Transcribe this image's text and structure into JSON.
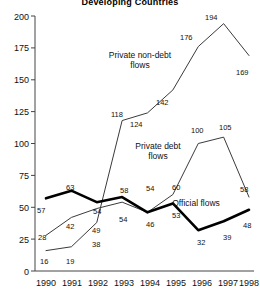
{
  "chart_data": {
    "type": "line",
    "title": "Developing Countries",
    "xlabel": "",
    "ylabel": "",
    "x": [
      "1990",
      "1991",
      "1992",
      "1993",
      "1994",
      "1995",
      "1996",
      "1997",
      "1998"
    ],
    "categories": [
      "1990",
      "1991",
      "1992",
      "1993",
      "1994",
      "1995",
      "1996",
      "1997",
      "1998"
    ],
    "ylim": [
      0,
      200
    ],
    "yticks": [
      0,
      25,
      50,
      75,
      100,
      125,
      150,
      175,
      200
    ],
    "ytick_labels": [
      "0",
      "25",
      "50",
      "75",
      "100",
      "125",
      "150",
      "175",
      "200"
    ],
    "grid": false,
    "legend_position": "inline-annotations",
    "series": [
      {
        "name": "Private non-debt flows",
        "style": "thin",
        "values": [
          16,
          19,
          38,
          118,
          124,
          142,
          176,
          194,
          169
        ],
        "point_labels": [
          "16",
          "19",
          "38",
          "118",
          "124",
          "142",
          "176",
          "194",
          "169"
        ]
      },
      {
        "name": "Private debt flows",
        "style": "thin",
        "values": [
          28,
          42,
          49,
          54,
          46,
          60,
          100,
          105,
          58
        ],
        "point_labels": [
          "28",
          "42",
          "49",
          "54",
          "46",
          "60",
          "100",
          "105",
          "58"
        ]
      },
      {
        "name": "Official flows",
        "style": "bold",
        "values": [
          57,
          63,
          54,
          58,
          46,
          53,
          32,
          39,
          48
        ],
        "point_labels": [
          "57",
          "63",
          "54",
          "58",
          "54",
          "53",
          "32",
          "39",
          "48"
        ]
      }
    ],
    "annotations": [
      {
        "text": "Private non-debt",
        "x": 140,
        "y": 58
      },
      {
        "text": "flows",
        "x": 140,
        "y": 68
      },
      {
        "text": "Private debt",
        "x": 157,
        "y": 148
      },
      {
        "text": "flows",
        "x": 157,
        "y": 158
      },
      {
        "text": "Official flows",
        "x": 200,
        "y": 205
      }
    ]
  },
  "axis": {
    "y_labels": [
      "200",
      "175",
      "150",
      "125",
      "100",
      "75",
      "50",
      "25",
      "0"
    ],
    "x_labels": [
      "1990",
      "1991",
      "1992",
      "1993",
      "1994",
      "1995",
      "1996",
      "1997",
      "1998"
    ]
  },
  "labels": {
    "private_non_debt_line1": "Private non-debt",
    "private_non_debt_line2": "flows",
    "private_debt_line1": "Private debt",
    "private_debt_line2": "flows",
    "official": "Official flows"
  },
  "point_text": {
    "nd": [
      "16",
      "19",
      "38",
      "118",
      "124",
      "142",
      "176",
      "194",
      "169"
    ],
    "pd": [
      "28",
      "42",
      "49",
      "54",
      "46",
      "60",
      "100",
      "105",
      "58"
    ],
    "of": [
      "57",
      "63",
      "54",
      "58",
      "54",
      "53",
      "32",
      "39",
      "48"
    ]
  }
}
